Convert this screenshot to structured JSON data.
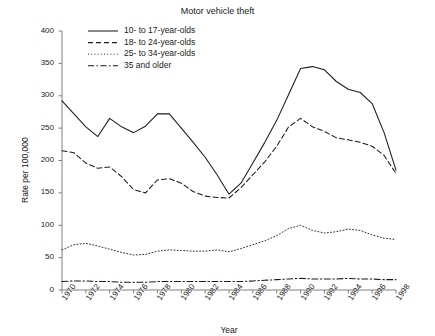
{
  "chart_data": {
    "type": "line",
    "title": "Motor vehicle theft",
    "xlabel": "Year",
    "ylabel": "Rate per 100,000",
    "xlim": [
      1970,
      1998
    ],
    "ylim": [
      0,
      400
    ],
    "ytick_values": [
      0,
      50,
      100,
      150,
      200,
      250,
      300,
      350,
      400
    ],
    "ytick_labels": [
      "0",
      "50",
      "100",
      "150",
      "200",
      "250",
      "300",
      "350",
      "400"
    ],
    "xtick_values": [
      1970,
      1972,
      1974,
      1976,
      1978,
      1980,
      1982,
      1984,
      1986,
      1988,
      1990,
      1992,
      1994,
      1996,
      1998
    ],
    "xtick_labels": [
      "1970",
      "1972",
      "1974",
      "1976",
      "1978",
      "1980",
      "1982",
      "1984",
      "1986",
      "1988",
      "1990",
      "1992",
      "1994",
      "1996",
      "1998"
    ],
    "grid": false,
    "legend_position": "upper-center",
    "x": [
      1970,
      1971,
      1972,
      1973,
      1974,
      1975,
      1976,
      1977,
      1978,
      1979,
      1980,
      1981,
      1982,
      1983,
      1984,
      1985,
      1986,
      1987,
      1988,
      1989,
      1990,
      1991,
      1992,
      1993,
      1994,
      1995,
      1996,
      1997,
      1998
    ],
    "series": [
      {
        "name": "10- to 17-year-olds",
        "style": "solid",
        "color": "#1a1a1a",
        "values": [
          292,
          272,
          252,
          237,
          265,
          252,
          243,
          253,
          272,
          272,
          250,
          228,
          205,
          178,
          148,
          165,
          196,
          228,
          262,
          302,
          342,
          345,
          340,
          322,
          310,
          305,
          288,
          243,
          185
        ]
      },
      {
        "name": "18- to 24-year-olds",
        "style": "dashed",
        "color": "#1a1a1a",
        "values": [
          215,
          212,
          196,
          188,
          190,
          175,
          155,
          150,
          170,
          172,
          165,
          152,
          145,
          143,
          142,
          158,
          178,
          198,
          222,
          252,
          265,
          252,
          245,
          235,
          232,
          228,
          222,
          208,
          180
        ]
      },
      {
        "name": "25- to 34-year-olds",
        "style": "dotted",
        "color": "#1a1a1a",
        "values": [
          62,
          70,
          72,
          68,
          63,
          58,
          54,
          55,
          60,
          62,
          61,
          60,
          60,
          62,
          59,
          64,
          70,
          76,
          84,
          95,
          100,
          92,
          88,
          90,
          94,
          92,
          85,
          80,
          78
        ]
      },
      {
        "name": "35 and older",
        "style": "dashdot",
        "color": "#1a1a1a",
        "values": [
          13,
          14,
          14,
          13,
          13,
          12,
          12,
          12,
          13,
          13,
          13,
          13,
          13,
          13,
          13,
          13,
          14,
          15,
          16,
          17,
          18,
          17,
          17,
          17,
          18,
          17,
          17,
          16,
          16
        ]
      }
    ]
  },
  "legend": {
    "entries": [
      {
        "label": "10- to 17-year-olds"
      },
      {
        "label": "18- to 24-year-olds"
      },
      {
        "label": "25- to 34-year-olds"
      },
      {
        "label": "35 and older"
      }
    ]
  },
  "axis": {
    "line_color": "#808080"
  }
}
